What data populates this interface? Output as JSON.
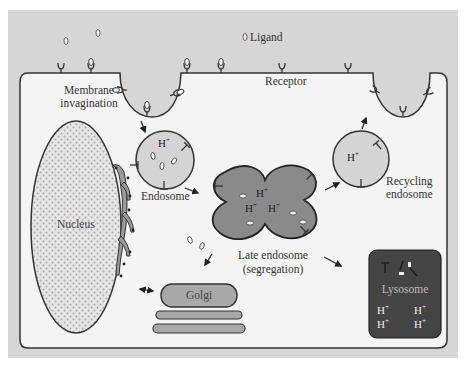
{
  "diagram": {
    "colors": {
      "extracellular": "#d6d6d6",
      "cytoplasm": "#f4f4f4",
      "outline": "#333333",
      "vesicle_fill": "#d4d4d4",
      "late_endosome_fill": "#8a8a8a",
      "lysosome_fill": "#444444",
      "golgi_fill": "#a8a8a8",
      "nucleus_fill": "#e4e4e4"
    },
    "labels": {
      "ligand": "Ligand",
      "receptor": "Receptor",
      "membrane_invagination_line1": "Membrane",
      "membrane_invagination_line2": "invagination",
      "endosome": "Endosome",
      "recycling_endosome_line1": "Recycling",
      "recycling_endosome_line2": "endosome",
      "late_endosome_line1": "Late endosome",
      "late_endosome_line2": "(segregation)",
      "nucleus": "Nucleus",
      "golgi": "Golgi",
      "lysosome": "Lysosome"
    },
    "proton": "H",
    "proton_charge": "+",
    "nodes": [
      {
        "id": "membrane-invagination",
        "label": "Membrane invagination"
      },
      {
        "id": "endosome",
        "label": "Endosome"
      },
      {
        "id": "late-endosome",
        "label": "Late endosome (segregation)"
      },
      {
        "id": "recycling-endosome",
        "label": "Recycling endosome"
      },
      {
        "id": "lysosome",
        "label": "Lysosome"
      },
      {
        "id": "golgi",
        "label": "Golgi"
      },
      {
        "id": "nucleus",
        "label": "Nucleus"
      }
    ],
    "edges": [
      {
        "from": "membrane-invagination",
        "to": "endosome"
      },
      {
        "from": "endosome",
        "to": "late-endosome"
      },
      {
        "from": "late-endosome",
        "to": "recycling-endosome"
      },
      {
        "from": "recycling-endosome",
        "to": "membrane-recycling"
      },
      {
        "from": "late-endosome",
        "to": "lysosome"
      },
      {
        "from": "late-endosome",
        "to": "golgi"
      },
      {
        "from": "golgi",
        "to": "nucleus",
        "bidirectional": true
      }
    ]
  }
}
